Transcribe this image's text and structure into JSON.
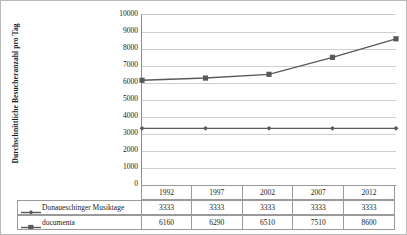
{
  "axis": {
    "y_title": "Durchschnittliche Besucheranzahl pro Tag",
    "y_ticks": [
      "10000",
      "9000",
      "8000",
      "7000",
      "6000",
      "5000",
      "4000",
      "3000",
      "2000",
      "1000",
      "0"
    ]
  },
  "table": {
    "years": [
      "1992",
      "1997",
      "2002",
      "2007",
      "2012"
    ],
    "rows": [
      {
        "label": "Donaueschinger Musiktage",
        "marker": "diamond-marker",
        "values": [
          "3333",
          "3333",
          "3333",
          "3333",
          "3333"
        ]
      },
      {
        "label": "documenta",
        "marker": "square-marker",
        "values": [
          "6160",
          "6290",
          "6510",
          "7510",
          "8600"
        ]
      }
    ]
  },
  "chart_data": {
    "type": "line",
    "title": "",
    "xlabel": "",
    "ylabel": "Durchschnittliche Besucheranzahl pro Tag",
    "categories": [
      "1992",
      "1997",
      "2002",
      "2007",
      "2012"
    ],
    "series": [
      {
        "name": "Donaueschinger Musiktage",
        "marker": "diamond",
        "color": "#595959",
        "values": [
          3333,
          3333,
          3333,
          3333,
          3333
        ]
      },
      {
        "name": "documenta",
        "marker": "square",
        "color": "#595959",
        "values": [
          6160,
          6290,
          6510,
          7510,
          8600
        ]
      }
    ],
    "ylim": [
      0,
      10000
    ],
    "ytick_step": 1000,
    "grid": "horizontal",
    "legend_position": "data-table"
  },
  "colors": {
    "series_line": "#595959",
    "gridline": "#cfcfcf",
    "axis": "#8c8c8c",
    "border": "#b9b9b9"
  }
}
